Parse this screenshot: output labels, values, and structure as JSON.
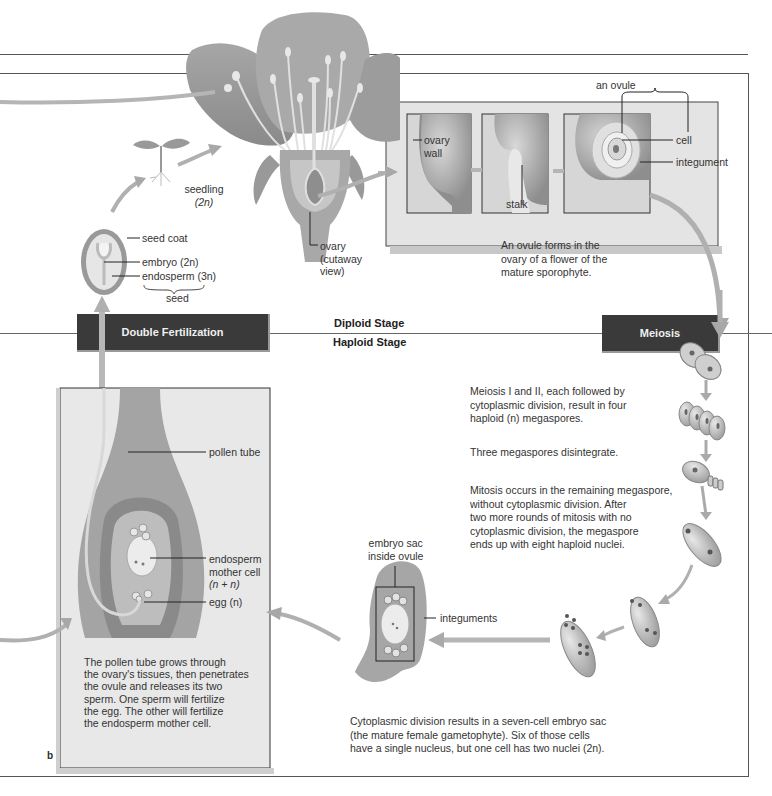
{
  "figure": {
    "panel_label": "b",
    "stages": {
      "diploid": "Diploid Stage",
      "haploid": "Haploid Stage"
    },
    "boxes": {
      "double_fertilization": "Double Fertilization",
      "meiosis": "Meiosis"
    }
  },
  "flower": {
    "ovary_label": [
      "ovary",
      "(cutaway",
      "view)"
    ]
  },
  "seedling": {
    "label": "seedling",
    "ploidy": "(2n)"
  },
  "seed": {
    "seed_coat": "seed coat",
    "embryo": "embryo (2n)",
    "endosperm": "endosperm (3n)",
    "seed": "seed"
  },
  "ovule_panel": {
    "ovary_wall": [
      "ovary",
      "wall"
    ],
    "stalk": "stalk",
    "an_ovule": "an ovule",
    "cell": "cell",
    "integument": "integument",
    "caption": [
      "An ovule forms in the",
      "ovary of a flower of the",
      "mature sporophyte."
    ]
  },
  "meiosis_steps": {
    "step1": [
      "Meiosis I and II, each followed by",
      "cytoplasmic division, result in four",
      "haploid (n) megaspores."
    ],
    "step2": "Three megaspores disintegrate.",
    "step3": [
      "Mitosis occurs in the remaining megaspore,",
      "without cytoplasmic division. After",
      "two more rounds of mitosis with no",
      "cytoplasmic division, the megaspore",
      "ends up with eight haploid nuclei."
    ]
  },
  "embryo_sac": {
    "label": [
      "embryo sac",
      "inside ovule"
    ],
    "integuments": "integuments",
    "caption": [
      "Cytoplasmic division results in a seven-cell embryo sac",
      "(the mature female gametophyte). Six of those cells",
      "have a single nucleus, but one cell has two nuclei (2n)."
    ]
  },
  "fertilization_panel": {
    "pollen_tube": "pollen tube",
    "endosperm_mother": [
      "endosperm",
      "mother cell",
      "(n + n)"
    ],
    "egg": "egg (n)",
    "caption": [
      "The pollen tube grows through",
      "the ovary's tissues, then penetrates",
      "the ovule and releases its two",
      "sperm. One sperm will fertilize",
      "the egg. The other will fertilize",
      "the endosperm mother cell."
    ]
  },
  "colors": {
    "dark_box": "#3a3a3a",
    "panel_gray": "#e6e6e6",
    "arrow_gray": "#a8a8a8",
    "tissue_mid": "#9a9a9a",
    "tissue_light": "#d4d4d4",
    "line": "#555555"
  }
}
